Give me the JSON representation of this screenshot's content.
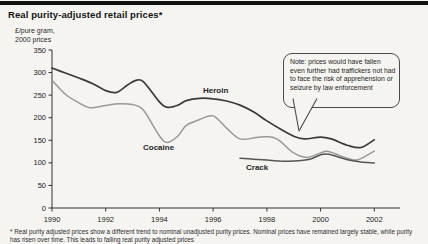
{
  "title": "Real purity-adjusted retail prices*",
  "chart_data": {
    "type": "line",
    "title": "Real purity-adjusted retail prices*",
    "unit_label": [
      "£/pure gram,",
      "2000 prices"
    ],
    "xlim": [
      1990,
      2002
    ],
    "ylim": [
      0,
      350
    ],
    "grid": false,
    "legend_position": "inline-labels",
    "x_ticks": [
      "1990",
      "1992",
      "1994",
      "1996",
      "1998",
      "2000",
      "2002"
    ],
    "y_ticks": [
      "0",
      "50",
      "100",
      "150",
      "200",
      "250",
      "300",
      "350"
    ],
    "axis_color": "#333333",
    "series": [
      {
        "name": "Heroin",
        "color": "#3a3a3a",
        "stroke_width": 1.7,
        "points": [
          [
            1990,
            310
          ],
          [
            1990.5,
            299
          ],
          [
            1991,
            288
          ],
          [
            1991.5,
            276
          ],
          [
            1992,
            260
          ],
          [
            1992.4,
            256
          ],
          [
            1992.8,
            272
          ],
          [
            1993.1,
            282
          ],
          [
            1993.4,
            280
          ],
          [
            1994,
            235
          ],
          [
            1994.3,
            223
          ],
          [
            1994.7,
            228
          ],
          [
            1995,
            238
          ],
          [
            1995.5,
            243
          ],
          [
            1996,
            242
          ],
          [
            1996.5,
            237
          ],
          [
            1997,
            228
          ],
          [
            1997.5,
            213
          ],
          [
            1998,
            193
          ],
          [
            1998.5,
            175
          ],
          [
            1999,
            159
          ],
          [
            1999.4,
            153
          ],
          [
            2000,
            157
          ],
          [
            2000.4,
            153
          ],
          [
            2001,
            139
          ],
          [
            2001.5,
            134
          ],
          [
            2002,
            151
          ]
        ]
      },
      {
        "name": "Cocaine",
        "color": "#989898",
        "stroke_width": 1.5,
        "points": [
          [
            1990,
            283
          ],
          [
            1990.5,
            252
          ],
          [
            1991,
            233
          ],
          [
            1991.4,
            222
          ],
          [
            1992,
            227
          ],
          [
            1992.5,
            231
          ],
          [
            1993,
            229
          ],
          [
            1993.4,
            217
          ],
          [
            1994,
            160
          ],
          [
            1994.3,
            145
          ],
          [
            1994.7,
            160
          ],
          [
            1995,
            183
          ],
          [
            1995.5,
            196
          ],
          [
            1996,
            204
          ],
          [
            1996.5,
            177
          ],
          [
            1997,
            153
          ],
          [
            1997.6,
            156
          ],
          [
            1998,
            158
          ],
          [
            1998.4,
            152
          ],
          [
            1999,
            122
          ],
          [
            1999.5,
            112
          ],
          [
            2000,
            122
          ],
          [
            2000.3,
            125
          ],
          [
            2001,
            110
          ],
          [
            2001.4,
            107
          ],
          [
            2002,
            126
          ]
        ]
      },
      {
        "name": "Crack",
        "color": "#555555",
        "stroke_width": 1.5,
        "points": [
          [
            1997,
            110
          ],
          [
            1997.5,
            108
          ],
          [
            1998,
            106
          ],
          [
            1998.5,
            104
          ],
          [
            1999,
            104
          ],
          [
            1999.6,
            108
          ],
          [
            2000,
            118
          ],
          [
            2000.3,
            119
          ],
          [
            2001,
            107
          ],
          [
            2001.5,
            102
          ],
          [
            2002,
            100
          ]
        ]
      }
    ]
  },
  "annotation": {
    "text": "Note: prices would have fallen even further had traffickers not had to face the risk of apprehension or seizure by law enforcement"
  },
  "footnote": {
    "text": "* Real purity adjusted prices show a different trend to nominal unadjusted purity prices. Nominal prices have remained largely stable, while purity has risen over time. This leads to falling real purity adjusted prices"
  }
}
